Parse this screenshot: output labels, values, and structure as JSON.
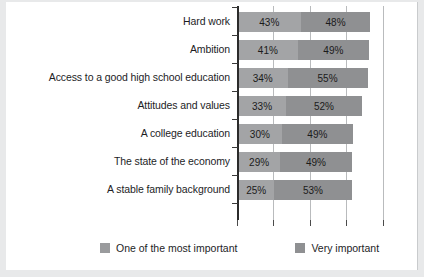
{
  "chart_data": {
    "type": "bar",
    "orientation": "horizontal",
    "stacked": true,
    "title": "",
    "subtitle": "",
    "xlabel": "",
    "ylabel": "",
    "xlim": [
      0,
      100
    ],
    "grid": true,
    "legend_position": "bottom",
    "tick_values": [
      0,
      25,
      50,
      75,
      100
    ],
    "categories": [
      "Hard work",
      "Ambition",
      "Access to a good high school education",
      "Attitudes and values",
      "A college education",
      "The state of the economy",
      "A stable family background"
    ],
    "series": [
      {
        "name": "One of the most important",
        "color": "#a3a4a6",
        "values": [
          43,
          41,
          34,
          33,
          30,
          29,
          25
        ],
        "labels": [
          "43%",
          "41%",
          "34%",
          "33%",
          "30%",
          "29%",
          "25%"
        ]
      },
      {
        "name": "Very important",
        "color": "#8f9092",
        "values": [
          48,
          49,
          55,
          52,
          49,
          49,
          53
        ],
        "labels": [
          "48%",
          "49%",
          "55%",
          "52%",
          "49%",
          "49%",
          "53%"
        ]
      }
    ]
  },
  "legend": {
    "items": [
      {
        "label": "One of the most important",
        "color": "#a3a4a6"
      },
      {
        "label": "Very important",
        "color": "#8f9092"
      }
    ]
  },
  "colors": {
    "page_background": "#e8e9ea",
    "plot_background": "#ffffff",
    "axis": "#2b2b2b",
    "gridline": "#b9bbbd",
    "text": "#1d1d1f"
  }
}
